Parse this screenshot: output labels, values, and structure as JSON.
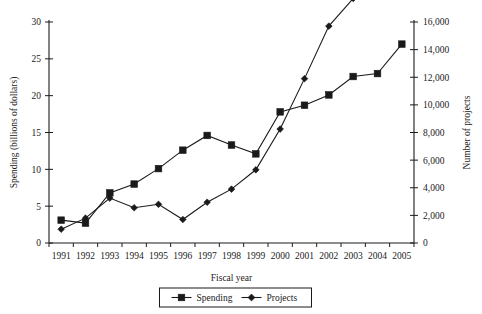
{
  "chart_data": {
    "type": "line",
    "title": "",
    "xlabel": "Fiscal year",
    "ylabel": "Spending (billions of dollars)",
    "y2label": "Number of projects",
    "grid": false,
    "legend_position": "bottom",
    "categories": [
      "1991",
      "1992",
      "1993",
      "1994",
      "1995",
      "1996",
      "1997",
      "1998",
      "1999",
      "2000",
      "2001",
      "2002",
      "2003",
      "2004",
      "2005"
    ],
    "ylim": [
      0,
      30
    ],
    "yticks": [
      "0",
      "5",
      "10",
      "15",
      "20",
      "25",
      "30"
    ],
    "ytick_values": [
      0,
      5,
      10,
      15,
      20,
      25,
      30
    ],
    "y2lim": [
      0,
      16000
    ],
    "y2ticks": [
      "0",
      "2,000",
      "4,000",
      "6,000",
      "8,000",
      "10,000",
      "12,000",
      "14,000",
      "16,000"
    ],
    "y2tick_values": [
      0,
      2000,
      4000,
      6000,
      8000,
      10000,
      12000,
      14000,
      16000
    ],
    "series": [
      {
        "name": "Spending",
        "axis": "left",
        "marker": "square",
        "units": "billions of dollars",
        "values": [
          3.1,
          2.7,
          6.8,
          8.0,
          10.1,
          12.6,
          14.6,
          13.3,
          12.1,
          17.8,
          18.7,
          20.1,
          22.6,
          23.0,
          27.0
        ]
      },
      {
        "name": "Projects",
        "axis": "right",
        "marker": "diamond",
        "units": "number of projects",
        "values": [
          1000,
          1800,
          3250,
          2550,
          2800,
          1700,
          2950,
          3900,
          5300,
          8250,
          11900,
          15700,
          17700,
          20100,
          27000
        ]
      }
    ],
    "legend": [
      "Spending",
      "Projects"
    ]
  }
}
